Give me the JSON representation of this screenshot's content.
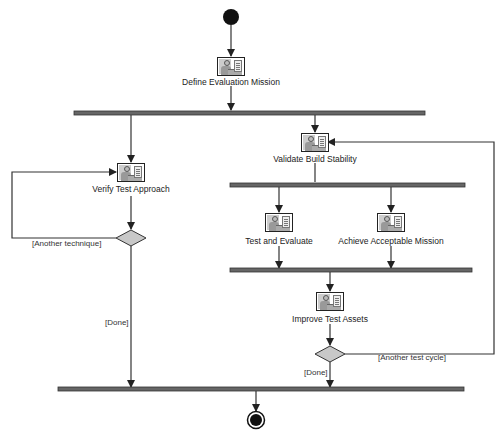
{
  "diagram": {
    "type": "UML activity diagram",
    "colors": {
      "line": "#333333",
      "bar": "#555555",
      "decision_fill": "#c8c8c8",
      "node": "#111111"
    },
    "activities": [
      {
        "id": "define",
        "label": "Define Evaluation Mission",
        "icon": "worker-activity-icon"
      },
      {
        "id": "verify",
        "label": "Verify Test Approach",
        "icon": "worker-activity-icon"
      },
      {
        "id": "validate",
        "label": "Validate Build Stability",
        "icon": "worker-activity-icon"
      },
      {
        "id": "test",
        "label": "Test and Evaluate",
        "icon": "worker-activity-icon"
      },
      {
        "id": "achieve",
        "label": "Achieve Acceptable Mission",
        "icon": "worker-activity-icon"
      },
      {
        "id": "improve",
        "label": "Improve Test Assets",
        "icon": "worker-activity-icon"
      }
    ],
    "guards": {
      "another_technique": "[Another technique]",
      "done_left": "[Done]",
      "another_test_cycle": "[Another test cycle]",
      "done_right": "[Done]"
    },
    "nodes": {
      "start": "initial-node",
      "end": "final-node",
      "fork_bars": 4,
      "decisions": 2
    }
  }
}
